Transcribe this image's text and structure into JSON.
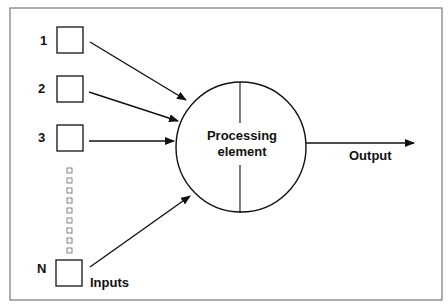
{
  "diagram": {
    "title": "Processing element",
    "center_label_line1": "Processing",
    "center_label_line2": "element",
    "output_label": "Output",
    "inputs_label": "Inputs",
    "inputs": [
      {
        "label": "1"
      },
      {
        "label": "2"
      },
      {
        "label": "3"
      },
      {
        "label": "N"
      }
    ],
    "ellipsis_squares": 9,
    "colors": {
      "stroke": "#111111",
      "frame": "#777777",
      "background": "#ffffff"
    }
  }
}
